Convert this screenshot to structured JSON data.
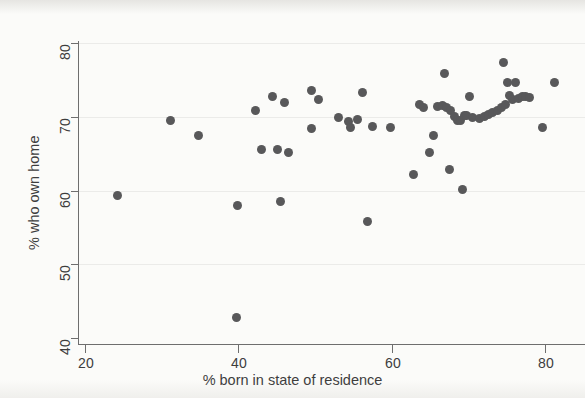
{
  "chart_data": {
    "type": "scatter",
    "title": "",
    "xlabel": "% born in state of residence",
    "ylabel": "% who own home",
    "xlim": [
      20,
      82.5
    ],
    "ylim": [
      39.5,
      80.5
    ],
    "xticks": [
      20,
      40,
      60,
      80
    ],
    "xtick_labels": [
      "20",
      "40",
      "60",
      "80"
    ],
    "yticks": [
      40,
      50,
      60,
      70,
      80
    ],
    "ytick_labels": [
      "40",
      "50",
      "60",
      "70",
      "80"
    ],
    "grid": false,
    "legend": null,
    "marker": {
      "shape": "circle",
      "color": "#58585a",
      "size_px": 9
    },
    "points": [
      {
        "x": 24.2,
        "y": 59.3
      },
      {
        "x": 31.1,
        "y": 69.5
      },
      {
        "x": 34.8,
        "y": 67.5
      },
      {
        "x": 39.8,
        "y": 42.8
      },
      {
        "x": 39.9,
        "y": 57.9
      },
      {
        "x": 42.3,
        "y": 70.8
      },
      {
        "x": 43.0,
        "y": 65.5
      },
      {
        "x": 44.4,
        "y": 72.7
      },
      {
        "x": 45.1,
        "y": 65.6
      },
      {
        "x": 45.5,
        "y": 58.5
      },
      {
        "x": 46.0,
        "y": 71.9
      },
      {
        "x": 46.6,
        "y": 65.1
      },
      {
        "x": 49.5,
        "y": 73.5
      },
      {
        "x": 49.6,
        "y": 68.4
      },
      {
        "x": 50.4,
        "y": 72.4
      },
      {
        "x": 53.0,
        "y": 69.9
      },
      {
        "x": 54.4,
        "y": 69.4
      },
      {
        "x": 54.6,
        "y": 68.5
      },
      {
        "x": 55.6,
        "y": 69.6
      },
      {
        "x": 56.2,
        "y": 73.3
      },
      {
        "x": 56.8,
        "y": 55.8
      },
      {
        "x": 57.5,
        "y": 68.7
      },
      {
        "x": 59.8,
        "y": 68.6
      },
      {
        "x": 62.9,
        "y": 62.2
      },
      {
        "x": 63.6,
        "y": 71.6
      },
      {
        "x": 64.1,
        "y": 71.2
      },
      {
        "x": 64.9,
        "y": 65.2
      },
      {
        "x": 65.4,
        "y": 67.5
      },
      {
        "x": 66.0,
        "y": 71.4
      },
      {
        "x": 66.6,
        "y": 71.5
      },
      {
        "x": 66.9,
        "y": 75.9
      },
      {
        "x": 67.2,
        "y": 71.2
      },
      {
        "x": 67.5,
        "y": 62.8
      },
      {
        "x": 67.7,
        "y": 70.8
      },
      {
        "x": 68.2,
        "y": 70.0
      },
      {
        "x": 68.6,
        "y": 69.5
      },
      {
        "x": 69.0,
        "y": 69.5
      },
      {
        "x": 69.3,
        "y": 60.1
      },
      {
        "x": 69.5,
        "y": 70.2
      },
      {
        "x": 69.8,
        "y": 70.2
      },
      {
        "x": 70.1,
        "y": 72.8
      },
      {
        "x": 70.6,
        "y": 69.9
      },
      {
        "x": 71.4,
        "y": 69.8
      },
      {
        "x": 72.1,
        "y": 70.0
      },
      {
        "x": 72.6,
        "y": 70.3
      },
      {
        "x": 73.2,
        "y": 70.6
      },
      {
        "x": 73.8,
        "y": 70.9
      },
      {
        "x": 74.3,
        "y": 71.2
      },
      {
        "x": 74.6,
        "y": 77.3
      },
      {
        "x": 74.8,
        "y": 71.6
      },
      {
        "x": 75.1,
        "y": 74.7
      },
      {
        "x": 75.4,
        "y": 72.9
      },
      {
        "x": 75.8,
        "y": 72.3
      },
      {
        "x": 76.2,
        "y": 74.7
      },
      {
        "x": 76.5,
        "y": 72.5
      },
      {
        "x": 77.0,
        "y": 72.7
      },
      {
        "x": 77.4,
        "y": 72.8
      },
      {
        "x": 78.0,
        "y": 72.6
      },
      {
        "x": 79.7,
        "y": 68.6
      },
      {
        "x": 81.2,
        "y": 74.6
      }
    ]
  }
}
